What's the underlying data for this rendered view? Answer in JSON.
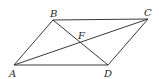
{
  "diagram": {
    "type": "geometry",
    "points": [
      {
        "id": "A",
        "label": "A",
        "x": 14,
        "y": 65,
        "label_x": 9,
        "label_y": 77
      },
      {
        "id": "B",
        "label": "B",
        "x": 53,
        "y": 20,
        "label_x": 50,
        "label_y": 17
      },
      {
        "id": "C",
        "label": "C",
        "x": 148,
        "y": 19,
        "label_x": 144,
        "label_y": 16
      },
      {
        "id": "D",
        "label": "D",
        "x": 108,
        "y": 65,
        "label_x": 104,
        "label_y": 77
      },
      {
        "id": "F",
        "label": "F",
        "x": 81,
        "y": 43,
        "label_x": 78,
        "label_y": 39
      }
    ],
    "segments": [
      {
        "from": "A",
        "to": "B"
      },
      {
        "from": "B",
        "to": "C"
      },
      {
        "from": "C",
        "to": "D"
      },
      {
        "from": "D",
        "to": "A"
      },
      {
        "from": "A",
        "to": "C"
      },
      {
        "from": "B",
        "to": "D"
      }
    ],
    "colors": {
      "line": "#3a3a3a",
      "label": "#2a2a2a",
      "background": "#ffffff"
    }
  }
}
